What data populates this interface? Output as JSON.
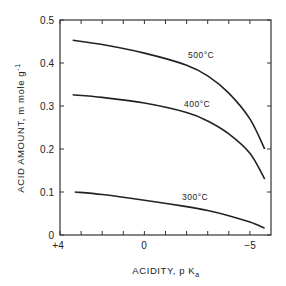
{
  "chart_data": {
    "type": "line",
    "title": "",
    "xlabel": "ACIDITY, p K_a",
    "ylabel": "ACID AMOUNT, m mole g^-1",
    "xlim": [
      4,
      -6
    ],
    "ylim": [
      0,
      0.5
    ],
    "x_ticks": [
      4,
      3,
      2,
      1,
      0,
      -1,
      -2,
      -3,
      -4,
      -5
    ],
    "x_tick_labels": [
      "+4",
      "0",
      "-5"
    ],
    "y_ticks": [
      0,
      0.1,
      0.2,
      0.3,
      0.4,
      0.5
    ],
    "y_tick_labels": [
      "0",
      "0.1",
      "0.2",
      "0.3",
      "0.4",
      "0.5"
    ],
    "grid": false,
    "legend": "inline labels",
    "series": [
      {
        "name": "500°C",
        "x": [
          3.4,
          2,
          0,
          -2,
          -3,
          -4,
          -5,
          -5.7
        ],
        "values": [
          0.453,
          0.443,
          0.423,
          0.395,
          0.37,
          0.33,
          0.27,
          0.2
        ]
      },
      {
        "name": "400°C",
        "x": [
          3.4,
          2,
          0,
          -2,
          -3,
          -4,
          -5,
          -5.7
        ],
        "values": [
          0.326,
          0.32,
          0.307,
          0.285,
          0.265,
          0.235,
          0.19,
          0.13
        ]
      },
      {
        "name": "300°C",
        "x": [
          3.3,
          2,
          0,
          -2,
          -3,
          -4,
          -5,
          -5.7
        ],
        "values": [
          0.1,
          0.094,
          0.081,
          0.066,
          0.057,
          0.045,
          0.03,
          0.016
        ]
      }
    ]
  },
  "labels": {
    "xlabel_main": "ACIDITY, p K",
    "xlabel_sub": "a",
    "ylabel_main": "ACID AMOUNT, m mole g",
    "ylabel_sup": "-1",
    "curve_500": "500°C",
    "curve_400": "400°C",
    "curve_300": "300°C",
    "y0": "0",
    "y1": "0.1",
    "y2": "0.2",
    "y3": "0.3",
    "y4": "0.4",
    "y5": "0.5",
    "x_plus4": "+4",
    "x_0": "0",
    "x_minus5": "−5"
  }
}
